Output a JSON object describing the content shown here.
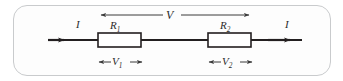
{
  "diagram": {
    "frame": {
      "stroke": "#c9cbcd",
      "fill": "#fdfdfd"
    },
    "wire": {
      "stroke": "#231f20",
      "y": 40
    },
    "labels": {
      "total_voltage": "V",
      "resistor_1": "R",
      "resistor_1_sub": "1",
      "resistor_2": "R",
      "resistor_2_sub": "2",
      "current_left": "I",
      "current_right": "I",
      "voltage_1": "V",
      "voltage_1_sub": "1",
      "voltage_2": "V",
      "voltage_2_sub": "2"
    },
    "resistors": [
      {
        "name": "R1",
        "x": 98,
        "y": 33,
        "width": 43,
        "height": 14
      },
      {
        "name": "R2",
        "x": 208,
        "y": 33,
        "width": 43,
        "height": 14
      }
    ],
    "arrows": {
      "total_span": {
        "from_x": 100,
        "to_x": 250,
        "y": 15,
        "double_headed": true
      },
      "v1_span": {
        "from_x": 98,
        "to_x": 141,
        "y": 62,
        "double_headed": true
      },
      "v2_span": {
        "from_x": 208,
        "to_x": 251,
        "y": 62,
        "double_headed": true
      },
      "current_left": {
        "from_x": 48,
        "to_x": 64,
        "y": 40
      },
      "current_right": {
        "from_x": 251,
        "to_x": 302,
        "y": 40
      }
    }
  }
}
